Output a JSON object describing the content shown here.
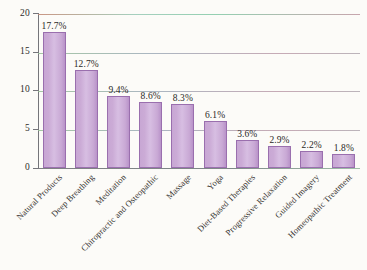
{
  "chart_data": {
    "type": "bar",
    "title": "",
    "subtitle": "",
    "xlabel": "",
    "ylabel": "",
    "ylim": [
      0,
      20
    ],
    "yticks": [
      0,
      5,
      10,
      15,
      20
    ],
    "ytick_labels": [
      "0",
      "5",
      "10",
      "15",
      "20"
    ],
    "grid": true,
    "legend": false,
    "legend_position": "none",
    "categories": [
      "Natural Products",
      "Deep Breathing",
      "Meditation",
      "Chiropractic and Osteopathic",
      "Massage",
      "Yoga",
      "Diet-Based Therapies",
      "Progressive Relaxation",
      "Guided Imagery",
      "Homeopathic Treatment"
    ],
    "values": [
      17.7,
      12.7,
      9.4,
      8.6,
      8.3,
      6.1,
      3.6,
      2.9,
      2.2,
      1.8
    ],
    "value_labels": [
      "17.7%",
      "12.7%",
      "9.4%",
      "8.6%",
      "8.3%",
      "6.1%",
      "3.6%",
      "2.9%",
      "2.2%",
      "1.8%"
    ],
    "colors": {
      "bar_fill": "#cdaad8",
      "bar_border": "#9a6fae",
      "background": "#fcfbf8",
      "axis": "#6e6e73",
      "text": "#2e2c2a"
    }
  }
}
